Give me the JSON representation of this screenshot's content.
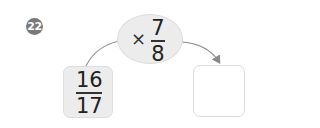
{
  "problem": {
    "number": "22",
    "operator": "×",
    "multiplier": {
      "numerator": "7",
      "denominator": "8"
    },
    "input": {
      "numerator": "16",
      "denominator": "17"
    },
    "answer": ""
  },
  "colors": {
    "badge": "#7a7a7a",
    "oval_fill": "#ececec",
    "box_fill": "#ececec",
    "answer_border": "#dcdcdc",
    "arrow": "#8a8a8a"
  }
}
